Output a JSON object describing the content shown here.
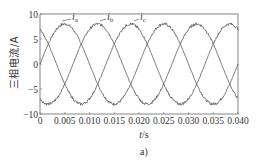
{
  "chart_data": {
    "type": "line",
    "title": "",
    "xlabel": "t/s",
    "ylabel": "三相电流/A",
    "caption": "a)",
    "xlim": [
      0,
      0.04
    ],
    "ylim": [
      -10,
      10
    ],
    "xticks": [
      "0",
      "0.005",
      "0.010",
      "0.015",
      "0.020",
      "0.025",
      "0.030",
      "0.035",
      "0.040"
    ],
    "yticks": [
      "10",
      "5",
      "0",
      "−5",
      "−10"
    ],
    "grid": false,
    "legend_position": "inline annotations near peaks",
    "series": [
      {
        "name": "ia",
        "label_main": "i",
        "label_sub": "a",
        "amplitude": 8,
        "frequency_hz": 50,
        "phase_deg": 0,
        "x": [
          0,
          0.005,
          0.01,
          0.015,
          0.02,
          0.025,
          0.03,
          0.035,
          0.04
        ],
        "values": [
          0,
          8,
          0,
          -8,
          0,
          8,
          0,
          -8,
          0
        ]
      },
      {
        "name": "ib",
        "label_main": "i",
        "label_sub": "b",
        "amplitude": 8,
        "frequency_hz": 50,
        "phase_deg": -120,
        "x": [
          0,
          0.005,
          0.01,
          0.015,
          0.02,
          0.025,
          0.03,
          0.035,
          0.04
        ],
        "values": [
          -6.9,
          -4,
          6.9,
          4,
          -6.9,
          -4,
          6.9,
          4,
          -6.9
        ]
      },
      {
        "name": "ic",
        "label_main": "i",
        "label_sub": "c",
        "amplitude": 8,
        "frequency_hz": 50,
        "phase_deg": 120,
        "x": [
          0,
          0.005,
          0.01,
          0.015,
          0.02,
          0.025,
          0.03,
          0.035,
          0.04
        ],
        "values": [
          6.9,
          -4,
          -6.9,
          4,
          6.9,
          -4,
          -6.9,
          4,
          6.9
        ]
      }
    ]
  }
}
